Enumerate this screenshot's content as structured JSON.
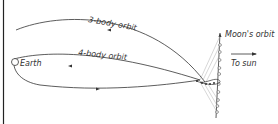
{
  "diagram": {
    "labels": {
      "three_body": "3-body orbit",
      "four_body": "4-body orbit",
      "earth": "Earth",
      "moon_orbit": "Moon's orbit",
      "to_sun": "To sun"
    },
    "colors": {
      "line": "#333333",
      "background": "#ffffff",
      "thin_line": "#888888"
    }
  }
}
